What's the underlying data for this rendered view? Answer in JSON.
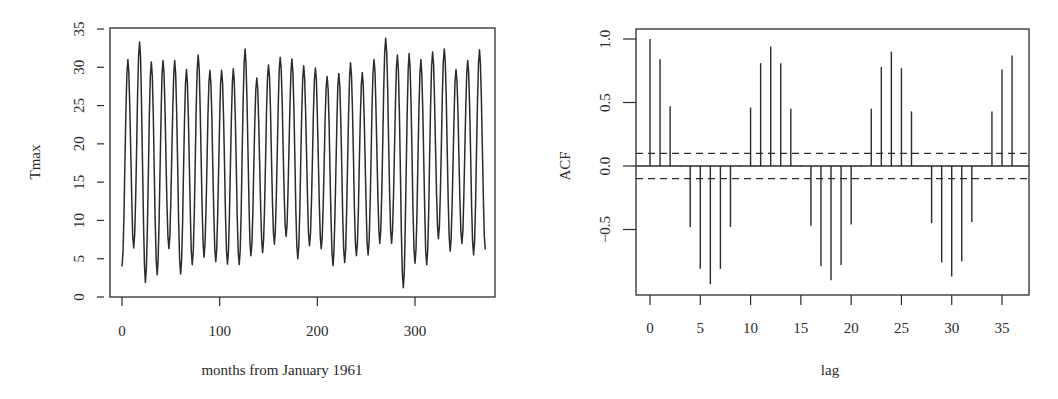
{
  "chart_data": [
    {
      "type": "line",
      "title": "",
      "xlabel": "months from January 1961",
      "ylabel": "Tmax",
      "xlim": [
        -13,
        381
      ],
      "ylim": [
        0,
        35
      ],
      "xticks": [
        0,
        100,
        200,
        300
      ],
      "yticks": [
        0,
        5,
        10,
        15,
        20,
        25,
        30,
        35
      ],
      "grid": false,
      "legend": null,
      "series": [
        {
          "name": "Tmax",
          "description": "Monthly maximum temperature, seasonal cycle (period 12 months), starting January 1961",
          "start_value": 4.0,
          "peaks": [
            31.0,
            33.3,
            30.7,
            30.9,
            30.9,
            29.7,
            31.6,
            29.6,
            29.6,
            29.8,
            32.4,
            28.6,
            30.3,
            31.3,
            31.1,
            30.2,
            29.9,
            28.8,
            29.2,
            30.6,
            29.3,
            31.0,
            33.8,
            31.6,
            31.8,
            31.0,
            32.0,
            32.4,
            29.7,
            30.9,
            32.3
          ],
          "troughs": [
            6.4,
            1.9,
            2.9,
            6.3,
            3.0,
            4.2,
            5.2,
            4.6,
            4.3,
            4.2,
            5.4,
            5.8,
            6.9,
            7.9,
            5.0,
            6.7,
            6.3,
            4.1,
            4.5,
            5.4,
            5.5,
            7.0,
            7.0,
            1.2,
            4.4,
            4.2,
            7.6,
            6.0,
            7.0,
            5.5
          ],
          "end_value": 6.2,
          "n_months": 373
        }
      ]
    },
    {
      "type": "bar",
      "subtype": "acf-stem",
      "title": "",
      "xlabel": "lag",
      "ylabel": "ACF",
      "xlim": [
        -1.5,
        37.5
      ],
      "ylim": [
        -0.95,
        1.05
      ],
      "xticks": [
        0,
        5,
        10,
        15,
        20,
        25,
        30,
        35
      ],
      "yticks": [
        -0.5,
        0.0,
        0.5,
        1.0
      ],
      "grid": false,
      "legend": null,
      "categories": [
        0,
        1,
        2,
        3,
        4,
        5,
        6,
        7,
        8,
        9,
        10,
        11,
        12,
        13,
        14,
        15,
        16,
        17,
        18,
        19,
        20,
        21,
        22,
        23,
        24,
        25,
        26,
        27,
        28,
        29,
        30,
        31,
        32,
        33,
        34,
        35,
        36
      ],
      "values": [
        1.0,
        0.84,
        0.47,
        0.0,
        -0.48,
        -0.81,
        -0.93,
        -0.81,
        -0.48,
        0.0,
        0.46,
        0.81,
        0.94,
        0.81,
        0.45,
        0.0,
        -0.47,
        -0.79,
        -0.9,
        -0.78,
        -0.46,
        0.0,
        0.45,
        0.78,
        0.9,
        0.77,
        0.43,
        0.0,
        -0.45,
        -0.76,
        -0.87,
        -0.75,
        -0.44,
        0.0,
        0.43,
        0.76,
        0.87
      ],
      "confidence_band": [
        -0.1,
        0.1
      ],
      "annotations": [
        "dashed lines at approximately ±0.10 (significance bounds)",
        "solid horizontal line at 0"
      ]
    }
  ],
  "left": {
    "ylabel": "Tmax",
    "xlabel": "months from January 1961",
    "xtick_labels": [
      "0",
      "100",
      "200",
      "300"
    ],
    "ytick_labels": [
      "0",
      "5",
      "10",
      "15",
      "20",
      "25",
      "30",
      "35"
    ]
  },
  "right": {
    "ylabel": "ACF",
    "xlabel": "lag",
    "xtick_labels": [
      "0",
      "5",
      "10",
      "15",
      "20",
      "25",
      "30",
      "35"
    ],
    "ytick_labels": [
      "-0.5",
      "0.0",
      "0.5",
      "1.0"
    ]
  },
  "colors": {
    "line": "#2b2b2b",
    "frame": "#2b2b2b",
    "background": "#ffffff"
  }
}
